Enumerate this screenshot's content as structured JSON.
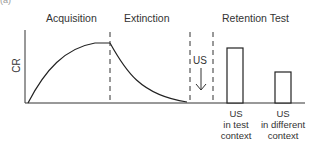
{
  "panel_label": "(a)",
  "phases": {
    "acquisition": "Acquisition",
    "extinction": "Extinction",
    "retention": "Retention Test"
  },
  "y_axis_label": "CR",
  "us_marker": {
    "label": "US",
    "arrow": "down-arrow"
  },
  "bars": [
    {
      "label_lines": [
        "US",
        "in test",
        "context"
      ],
      "relative_height": 0.87
    },
    {
      "label_lines": [
        "US",
        "in different",
        "context"
      ],
      "relative_height": 0.47
    }
  ],
  "colors": {
    "line": "#222222",
    "background": "#ffffff"
  }
}
